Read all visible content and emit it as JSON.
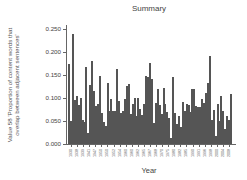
{
  "chart_data": {
    "type": "bar",
    "title": "Summary",
    "xlabel": "Year",
    "ylabel": "Value 58 'Proportion of content words that overlap between adjacent sentences'",
    "ylim": [
      0,
      0.26
    ],
    "yticks": [
      "0.000",
      "0.050",
      "0.100",
      "0.150",
      "0.200",
      "0.250"
    ],
    "grid": false,
    "legend": null,
    "xtick_labels": [
      "1930",
      "1938",
      "1939",
      "1941",
      "1947",
      "1950",
      "1950",
      "1952",
      "1954",
      "1960",
      "1960",
      "1962",
      "1965",
      "1967",
      "1968",
      "1970",
      "1975",
      "1980",
      "1982",
      "1985",
      "1990",
      "1991",
      "1996",
      "1998",
      "2000",
      "2004",
      "2008"
    ],
    "values": [
      0.173,
      0.05,
      0.24,
      0.095,
      0.104,
      0.084,
      0.1,
      0.052,
      0.047,
      0.168,
      0.025,
      0.129,
      0.18,
      0.115,
      0.082,
      0.088,
      0.147,
      0.067,
      0.048,
      0.04,
      0.133,
      0.072,
      0.097,
      0.072,
      0.071,
      0.162,
      0.094,
      0.067,
      0.072,
      0.098,
      0.127,
      0.13,
      0.066,
      0.087,
      0.099,
      0.06,
      0.099,
      0.077,
      0.062,
      0.088,
      0.147,
      0.146,
      0.176,
      0.142,
      0.046,
      0.09,
      0.12,
      0.084,
      0.065,
      0.122,
      0.087,
      0.07,
      0.057,
      0.012,
      0.146,
      0.068,
      0.043,
      0.061,
      0.036,
      0.092,
      0.072,
      0.086,
      0.085,
      0.07,
      0.119,
      0.119,
      0.083,
      0.081,
      0.08,
      0.098,
      0.09,
      0.111,
      0.133,
      0.192,
      0.052,
      0.075,
      0.018,
      0.086,
      0.05,
      0.104,
      0.071,
      0.033,
      0.061,
      0.052,
      0.108
    ],
    "bar_color": "#7a7a7a"
  }
}
